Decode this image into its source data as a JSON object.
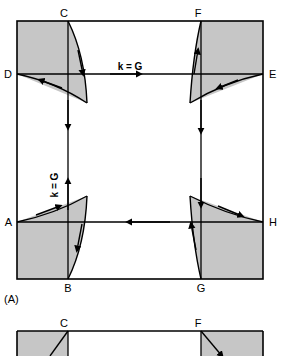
{
  "figure": {
    "panels": [
      {
        "id": "panel-a",
        "caption": "(A)",
        "caption_x": 4,
        "caption_y": 303,
        "frame": {
          "left": 17,
          "top": 21,
          "right": 263,
          "bottom": 279
        },
        "midline_y": 74,
        "lower_line_y": 222,
        "vertical_left_x": 68,
        "vertical_right_x": 201,
        "vertex_labels": [
          {
            "text": "C",
            "x": 64,
            "y": 17,
            "anchor": "middle"
          },
          {
            "text": "F",
            "x": 198,
            "y": 17,
            "anchor": "middle"
          },
          {
            "text": "D",
            "x": 12,
            "y": 78,
            "anchor": "end"
          },
          {
            "text": "E",
            "x": 269,
            "y": 78,
            "anchor": "start"
          },
          {
            "text": "A",
            "x": 12,
            "y": 226,
            "anchor": "end"
          },
          {
            "text": "H",
            "x": 269,
            "y": 226,
            "anchor": "start"
          },
          {
            "text": "B",
            "x": 68,
            "y": 292,
            "anchor": "middle"
          },
          {
            "text": "G",
            "x": 201,
            "y": 292,
            "anchor": "middle"
          }
        ],
        "vector_labels": [
          {
            "text": "k = G",
            "x": 130,
            "y": 70,
            "rotation": 0,
            "name": "k-equals-g-horizontal"
          },
          {
            "text": "k = G",
            "x": 58,
            "y": 185,
            "rotation": -90,
            "name": "k-equals-g-vertical"
          }
        ]
      },
      {
        "id": "panel-b",
        "caption": "",
        "frame": {
          "left": 17,
          "top": 331,
          "right": 263,
          "bottom": 356
        },
        "vertical_left_x": 68,
        "vertical_right_x": 201,
        "vertex_labels": [
          {
            "text": "C",
            "x": 64,
            "y": 327,
            "anchor": "middle"
          },
          {
            "text": "F",
            "x": 198,
            "y": 327,
            "anchor": "middle"
          }
        ]
      }
    ],
    "style": {
      "shading_color": "#c6c6c6",
      "line_color": "#000000",
      "background_color": "#ffffff",
      "frame_stroke_width": 1.6,
      "curve_stroke_width": 1.4
    }
  }
}
